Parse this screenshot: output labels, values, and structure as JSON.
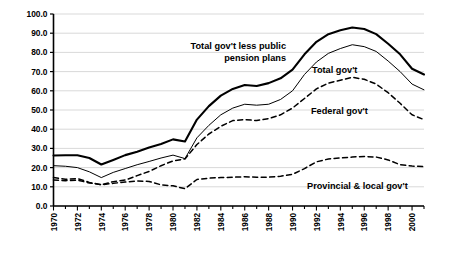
{
  "chart_data": {
    "type": "line",
    "title": "",
    "subtitle": "",
    "xlabel": "",
    "ylabel": "",
    "xlim": [
      1970,
      2001
    ],
    "ylim": [
      0.0,
      100.0
    ],
    "grid": true,
    "legend_position": "inline-annotations",
    "y_ticks": [
      "0.0",
      "10.0",
      "20.0",
      "30.0",
      "40.0",
      "50.0",
      "60.0",
      "70.0",
      "80.0",
      "90.0",
      "100.0"
    ],
    "y_tick_values": [
      0,
      10,
      20,
      30,
      40,
      50,
      60,
      70,
      80,
      90,
      100
    ],
    "x_ticks": [
      "1970",
      "1972",
      "1974",
      "1976",
      "1978",
      "1980",
      "1982",
      "1984",
      "1986",
      "1988",
      "1990",
      "1992",
      "1994",
      "1996",
      "1998",
      "2000"
    ],
    "x_tick_values": [
      1970,
      1972,
      1974,
      1976,
      1978,
      1980,
      1982,
      1984,
      1986,
      1988,
      1990,
      1992,
      1994,
      1996,
      1998,
      2000
    ],
    "x": [
      1970,
      1971,
      1972,
      1973,
      1974,
      1975,
      1976,
      1977,
      1978,
      1979,
      1980,
      1981,
      1982,
      1983,
      1984,
      1985,
      1986,
      1987,
      1988,
      1989,
      1990,
      1991,
      1992,
      1993,
      1994,
      1995,
      1996,
      1997,
      1998,
      1999,
      2000,
      2001
    ],
    "series": [
      {
        "name": "Total gov't less public pension plans",
        "style": "solid-thick",
        "color": "#000000",
        "values": [
          26.3,
          26.4,
          26.4,
          25.0,
          21.6,
          24.0,
          26.5,
          28.3,
          30.5,
          32.3,
          34.7,
          33.6,
          45.0,
          52.0,
          57.5,
          61.0,
          63.0,
          62.5,
          64.0,
          66.5,
          71.0,
          79.0,
          85.5,
          89.5,
          91.5,
          93.0,
          92.2,
          89.5,
          84.5,
          79.0,
          71.5,
          68.5
        ]
      },
      {
        "name": "Total gov't",
        "style": "solid-thin",
        "color": "#000000",
        "values": [
          21.0,
          20.7,
          20.0,
          17.8,
          14.8,
          17.5,
          19.5,
          21.5,
          23.2,
          25.0,
          26.5,
          24.7,
          35.5,
          42.0,
          47.5,
          51.0,
          53.0,
          52.5,
          53.0,
          55.5,
          60.0,
          68.5,
          75.0,
          79.5,
          82.0,
          84.0,
          83.0,
          80.5,
          75.5,
          70.0,
          63.5,
          60.5
        ]
      },
      {
        "name": "Federal gov't",
        "style": "dashed",
        "color": "#000000",
        "values": [
          14.8,
          13.9,
          14.3,
          12.3,
          11.0,
          12.7,
          13.5,
          15.8,
          18.0,
          21.0,
          23.5,
          24.5,
          32.0,
          37.5,
          41.5,
          44.5,
          45.0,
          44.5,
          45.5,
          47.5,
          51.0,
          56.0,
          61.0,
          64.0,
          65.5,
          67.0,
          66.0,
          63.5,
          59.0,
          53.5,
          47.5,
          45.0
        ]
      },
      {
        "name": "Provincial & local gov't",
        "style": "dashed",
        "color": "#000000",
        "values": [
          13.5,
          13.2,
          13.5,
          12.0,
          11.1,
          11.8,
          12.5,
          13.0,
          12.8,
          11.0,
          10.5,
          9.0,
          13.8,
          14.5,
          14.8,
          15.0,
          15.2,
          15.0,
          15.0,
          15.5,
          16.5,
          19.5,
          23.0,
          24.5,
          25.0,
          25.5,
          25.8,
          25.5,
          24.0,
          21.5,
          20.8,
          20.5
        ]
      }
    ],
    "annotations": [
      {
        "name": "total-gov-less-pension-label",
        "line1": "Total gov't less public",
        "line2": "pension plans"
      },
      {
        "name": "total-gov-label",
        "text": "Total gov't"
      },
      {
        "name": "federal-gov-label",
        "text": "Federal gov't"
      },
      {
        "name": "provincial-local-gov-label",
        "text": "Provincial & local gov't"
      }
    ]
  }
}
